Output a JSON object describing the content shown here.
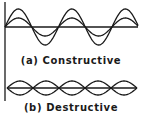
{
  "figure": {
    "panels": [
      {
        "id": "a",
        "caption": "(a) Constructive",
        "description": "two in-phase sine waves of different amplitude"
      },
      {
        "id": "b",
        "caption": "(b) Destructive",
        "description": "two out-of-phase sine waves of equal amplitude"
      }
    ],
    "colors": {
      "line": "#1a1a1a",
      "background": "#ffffff"
    }
  }
}
